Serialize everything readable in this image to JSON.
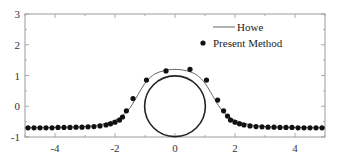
{
  "chart_data": {
    "type": "scatter",
    "title": "",
    "xlabel": "",
    "ylabel": "",
    "xlim": [
      -5,
      5
    ],
    "ylim": [
      -1,
      3
    ],
    "xticks": [
      -4,
      -2,
      0,
      2,
      4
    ],
    "yticks": [
      -1,
      0,
      1,
      2,
      3
    ],
    "grid": false,
    "legend_position": "upper right",
    "legend": [
      "Howe",
      "Present Method"
    ],
    "series": [
      {
        "name": "Howe",
        "kind": "line",
        "color": "#555555",
        "x": [
          -5,
          -4,
          -3,
          -2.5,
          -2,
          -1.75,
          -1.5,
          -1.25,
          -1,
          -0.75,
          -0.5,
          -0.25,
          0,
          0.25,
          0.5,
          0.75,
          1,
          1.25,
          1.5,
          1.75,
          2,
          2.5,
          3,
          4,
          5
        ],
        "y": [
          -0.7,
          -0.69,
          -0.66,
          -0.6,
          -0.45,
          -0.3,
          -0.05,
          0.35,
          0.75,
          1.0,
          1.12,
          1.18,
          1.2,
          1.18,
          1.12,
          1.0,
          0.75,
          0.35,
          -0.05,
          -0.3,
          -0.45,
          -0.6,
          -0.66,
          -0.69,
          -0.7
        ]
      },
      {
        "name": "Present Method",
        "kind": "markers",
        "color": "#111111",
        "x": [
          -4.9,
          -4.7,
          -4.5,
          -4.3,
          -4.1,
          -3.9,
          -3.7,
          -3.5,
          -3.3,
          -3.1,
          -2.9,
          -2.7,
          -2.5,
          -2.3,
          -2.15,
          -2.0,
          -1.85,
          -1.75,
          -1.62,
          -1.4,
          -0.95,
          -0.3,
          0.5,
          1.05,
          1.42,
          1.62,
          1.75,
          1.85,
          2.0,
          2.15,
          2.3,
          2.5,
          2.7,
          2.9,
          3.1,
          3.3,
          3.5,
          3.7,
          3.9,
          4.1,
          4.3,
          4.5,
          4.7,
          4.9
        ],
        "y": [
          -0.7,
          -0.7,
          -0.7,
          -0.7,
          -0.7,
          -0.69,
          -0.69,
          -0.69,
          -0.68,
          -0.68,
          -0.67,
          -0.66,
          -0.64,
          -0.61,
          -0.57,
          -0.52,
          -0.45,
          -0.35,
          -0.15,
          0.25,
          0.85,
          1.15,
          1.2,
          0.85,
          0.2,
          -0.15,
          -0.32,
          -0.45,
          -0.52,
          -0.57,
          -0.61,
          -0.64,
          -0.66,
          -0.67,
          -0.68,
          -0.68,
          -0.69,
          -0.69,
          -0.69,
          -0.7,
          -0.7,
          -0.7,
          -0.7,
          -0.7
        ]
      },
      {
        "name": "Cylinder",
        "kind": "circle",
        "color": "#222222",
        "center": [
          0,
          0
        ],
        "radius": 1
      }
    ]
  },
  "legend": {
    "line_label": "Howe",
    "marker_label": "Present Method"
  },
  "axes": {
    "x_tick_labels": [
      "-4",
      "-2",
      "0",
      "2",
      "4"
    ],
    "y_tick_labels": [
      "-1",
      "0",
      "1",
      "2",
      "3"
    ]
  }
}
